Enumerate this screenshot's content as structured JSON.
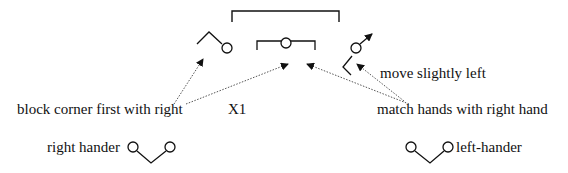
{
  "diagram": {
    "labels": {
      "move": "move slightly left",
      "match": "match hands with right hand",
      "block": "block corner first with right",
      "x1": "X1",
      "right_hander": "right hander",
      "left_hander": "left-hander"
    },
    "elements": [
      {
        "id": "top-bracket",
        "kind": "bracket"
      },
      {
        "id": "left-player",
        "kind": "stick-figure"
      },
      {
        "id": "middle-bracket-player",
        "kind": "bracket-with-circle"
      },
      {
        "id": "right-player",
        "kind": "stick-figure-with-arrow"
      },
      {
        "id": "right-hander-symbol",
        "kind": "v-shape-two-circles"
      },
      {
        "id": "left-hander-symbol",
        "kind": "v-shape-two-circles"
      }
    ],
    "colors": {
      "line": "#111111",
      "dotted": "#555555",
      "background": "#ffffff"
    }
  }
}
